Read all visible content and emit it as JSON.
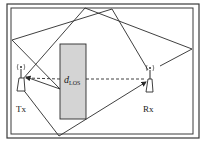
{
  "diagram": {
    "title": "",
    "colors": {
      "line": "#2a2a2a",
      "obstacle_fill": "#d4d4d4",
      "border": "#3a3a3a"
    },
    "nodes": {
      "tx": {
        "label": "Tx",
        "icon": "antenna-icon"
      },
      "rx": {
        "label": "Rx",
        "icon": "antenna-icon"
      }
    },
    "obstacle": {
      "label": "d",
      "label_sub": "LOS"
    },
    "paths": [
      {
        "name": "los-path",
        "style": "dashed",
        "from": "Rx",
        "to": "Tx"
      },
      {
        "name": "obstacle-reflection",
        "style": "solid",
        "from": "Tx",
        "to": "Tx"
      },
      {
        "name": "multipath-top-left",
        "style": "solid"
      },
      {
        "name": "multipath-top-right",
        "style": "solid"
      },
      {
        "name": "multipath-bottom",
        "style": "solid"
      }
    ]
  }
}
